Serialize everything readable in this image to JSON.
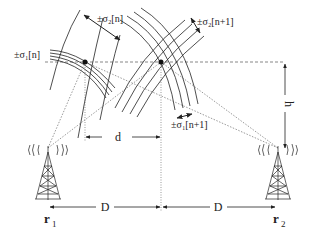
{
  "diagram": {
    "labels": {
      "sigma2_n": "±σ₂[n]",
      "sigma2_n1": "±σ₂[n+1]",
      "sigma1_n": "±σ₁[n]",
      "sigma1_n1": "±σ₁[n+1]",
      "d": "d",
      "D_left": "D",
      "D_right": "D",
      "h": "h",
      "r1": "r",
      "r1_sub": "1",
      "r2": "r",
      "r2_sub": "2"
    },
    "colors": {
      "stroke": "#222222",
      "background": "#ffffff"
    }
  }
}
